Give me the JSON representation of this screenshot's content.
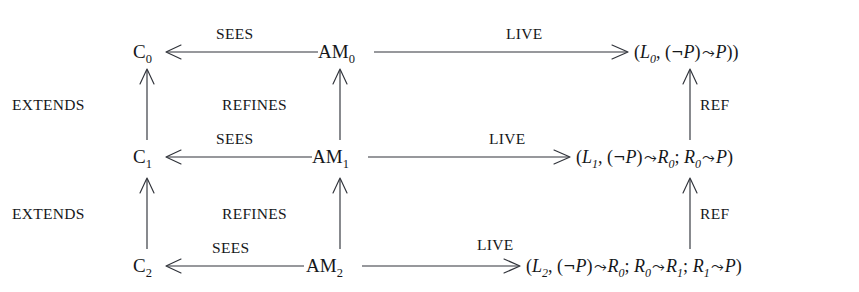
{
  "diagram": {
    "background_color": "#ffffff",
    "stroke_color": "#30333a",
    "text_color": "#15171a",
    "nodes": {
      "context": [
        {
          "id": "C0",
          "base": "C",
          "sub": "0"
        },
        {
          "id": "C1",
          "base": "C",
          "sub": "1"
        },
        {
          "id": "C2",
          "base": "C",
          "sub": "2"
        }
      ],
      "machine": [
        {
          "id": "AM0",
          "base": "AM",
          "sub": "0"
        },
        {
          "id": "AM1",
          "base": "AM",
          "sub": "1"
        },
        {
          "id": "AM2",
          "base": "AM",
          "sub": "2"
        }
      ]
    },
    "formulas": [
      {
        "id": "F0",
        "plain": "(L0, (¬P) ⤳ P))",
        "parts": [
          {
            "t": "(",
            "k": "paren"
          },
          {
            "t": "L",
            "k": "ital"
          },
          {
            "t": "0",
            "k": "sub"
          },
          {
            "t": ", ",
            "k": "plain"
          },
          {
            "t": "(",
            "k": "paren"
          },
          {
            "t": "¬",
            "k": "neg"
          },
          {
            "t": "P",
            "k": "ital"
          },
          {
            "t": ")",
            "k": "paren"
          },
          {
            "t": "⤳",
            "k": "squiggle"
          },
          {
            "t": "P",
            "k": "ital"
          },
          {
            "t": "))",
            "k": "paren"
          }
        ]
      },
      {
        "id": "F1",
        "plain": "(L1, (¬P) ⤳ R0; R0 ⤳ P)",
        "parts": [
          {
            "t": "(",
            "k": "paren"
          },
          {
            "t": "L",
            "k": "ital"
          },
          {
            "t": "1",
            "k": "sub"
          },
          {
            "t": ", ",
            "k": "plain"
          },
          {
            "t": "(",
            "k": "paren"
          },
          {
            "t": "¬",
            "k": "neg"
          },
          {
            "t": "P",
            "k": "ital"
          },
          {
            "t": ")",
            "k": "paren"
          },
          {
            "t": "⤳",
            "k": "squiggle"
          },
          {
            "t": "R",
            "k": "ital"
          },
          {
            "t": "0",
            "k": "sub"
          },
          {
            "t": "; ",
            "k": "plain"
          },
          {
            "t": "R",
            "k": "ital"
          },
          {
            "t": "0",
            "k": "sub"
          },
          {
            "t": "⤳",
            "k": "squiggle"
          },
          {
            "t": "P",
            "k": "ital"
          },
          {
            "t": ")",
            "k": "paren"
          }
        ]
      },
      {
        "id": "F2",
        "plain": "(L2, (¬P) ⤳ R0; R0 ⤳ R1; R1 ⤳ P)",
        "parts": [
          {
            "t": "(",
            "k": "paren"
          },
          {
            "t": "L",
            "k": "ital"
          },
          {
            "t": "2",
            "k": "sub"
          },
          {
            "t": ", ",
            "k": "plain"
          },
          {
            "t": "(",
            "k": "paren"
          },
          {
            "t": "¬",
            "k": "neg"
          },
          {
            "t": "P",
            "k": "ital"
          },
          {
            "t": ")",
            "k": "paren"
          },
          {
            "t": "⤳",
            "k": "squiggle"
          },
          {
            "t": "R",
            "k": "ital"
          },
          {
            "t": "0",
            "k": "sub"
          },
          {
            "t": "; ",
            "k": "plain"
          },
          {
            "t": "R",
            "k": "ital"
          },
          {
            "t": "0",
            "k": "sub"
          },
          {
            "t": "⤳",
            "k": "squiggle"
          },
          {
            "t": "R",
            "k": "ital"
          },
          {
            "t": "1",
            "k": "sub"
          },
          {
            "t": "; ",
            "k": "plain"
          },
          {
            "t": "R",
            "k": "ital"
          },
          {
            "t": "1",
            "k": "sub"
          },
          {
            "t": "⤳",
            "k": "squiggle"
          },
          {
            "t": "P",
            "k": "ital"
          },
          {
            "t": ")",
            "k": "paren"
          }
        ]
      }
    ],
    "edge_labels": {
      "sees_top": "SEES",
      "sees_middle": "SEES",
      "sees_bottom": "SEES",
      "live_top": "LIVE",
      "live_middle": "LIVE",
      "live_bottom": "LIVE",
      "extends_upper": "EXTENDS",
      "extends_lower": "EXTENDS",
      "refines_upper": "REFINES",
      "refines_lower": "REFINES",
      "ref_upper": "REF",
      "ref_lower": "REF"
    }
  }
}
